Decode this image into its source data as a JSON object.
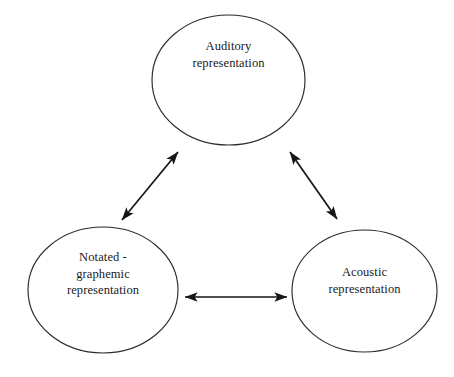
{
  "diagram": {
    "background_color": "#ffffff",
    "stroke_color": "#2b2b2b",
    "arrow_color": "#151515",
    "text_color": "#1a1a1a",
    "nodes": [
      {
        "id": "auditory",
        "label": "Auditory\nrepresentation",
        "shape": "ellipse",
        "position": "top-center"
      },
      {
        "id": "notated-graphemic",
        "label": "Notated -\ngraphemic\nrepresentation",
        "shape": "ellipse",
        "position": "bottom-left"
      },
      {
        "id": "acoustic",
        "label": "Acoustic\nrepresentation",
        "shape": "ellipse",
        "position": "bottom-right"
      }
    ],
    "connectors": [
      {
        "id": "notated-auditory",
        "from": "notated-graphemic",
        "to": "auditory",
        "style": "double-headed-arrow"
      },
      {
        "id": "auditory-acoustic",
        "from": "auditory",
        "to": "acoustic",
        "style": "double-headed-arrow"
      },
      {
        "id": "notated-acoustic",
        "from": "notated-graphemic",
        "to": "acoustic",
        "style": "double-headed-arrow"
      }
    ]
  }
}
